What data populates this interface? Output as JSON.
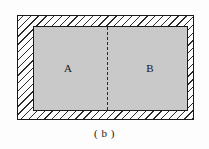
{
  "figure": {
    "caption": "( b )",
    "background_color": "#fdfdfd",
    "outer_region": {
      "name": "hatched-surround",
      "fill_pattern": "diagonal-hatch",
      "hatch_direction": "top-left-to-bottom-right",
      "hatch_color": "#2b2b2b",
      "border_color": "#1a1a1a",
      "label": ""
    },
    "inner_region": {
      "name": "shaded-rectangle",
      "fill_color": "#c9c9c9",
      "border_color": "#1a1a1a"
    },
    "divider": {
      "style": "dashed",
      "orientation": "vertical",
      "color": "#2b2b2b"
    },
    "labels": [
      {
        "id": "region-a",
        "text": "A"
      },
      {
        "id": "region-b",
        "text": "B"
      }
    ]
  }
}
